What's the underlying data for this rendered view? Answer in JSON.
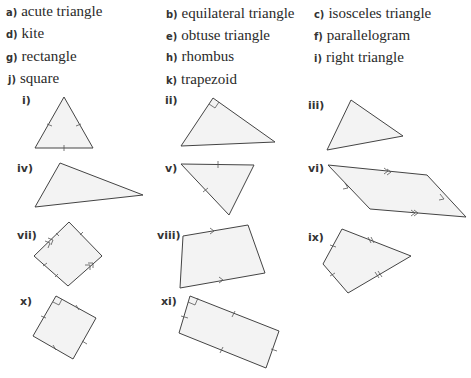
{
  "options": [
    {
      "letter": "a)",
      "text": "acute triangle"
    },
    {
      "letter": "b)",
      "text": "equilateral triangle"
    },
    {
      "letter": "c)",
      "text": "isosceles triangle"
    },
    {
      "letter": "d)",
      "text": "kite"
    },
    {
      "letter": "e)",
      "text": "obtuse triangle"
    },
    {
      "letter": "f)",
      "text": "parallelogram"
    },
    {
      "letter": "g)",
      "text": "rectangle"
    },
    {
      "letter": "h)",
      "text": "rhombus"
    },
    {
      "letter": "i)",
      "text": "right triangle"
    },
    {
      "letter": "j)",
      "text": "square"
    },
    {
      "letter": "k)",
      "text": "trapezoid"
    }
  ],
  "figures": [
    {
      "label": "i)",
      "markings": "three equal-side ticks"
    },
    {
      "label": "ii)",
      "markings": "right-angle mark"
    },
    {
      "label": "iii)",
      "markings": "none"
    },
    {
      "label": "iv)",
      "markings": "none"
    },
    {
      "label": "v)",
      "markings": "two equal-side ticks"
    },
    {
      "label": "vi)",
      "markings": "two pairs of parallel arrows"
    },
    {
      "label": "vii)",
      "markings": "four equal-side ticks, parallel arrows"
    },
    {
      "label": "viii)",
      "markings": "one pair of parallel arrows"
    },
    {
      "label": "ix)",
      "markings": "two pairs of adjacent equal sides"
    },
    {
      "label": "x)",
      "markings": "right-angle mark, four equal-side ticks"
    },
    {
      "label": "xi)",
      "markings": "right-angle mark, opposite equal sides"
    }
  ]
}
